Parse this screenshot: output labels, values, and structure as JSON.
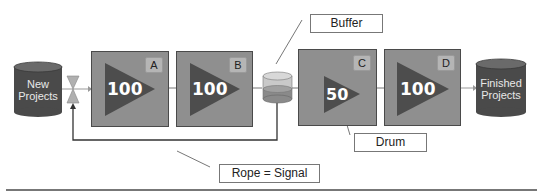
{
  "diagram": {
    "type": "drum-buffer-rope flow",
    "colors": {
      "box_fill": "#8f8f8f",
      "triangle_fill": "#4d4d4d",
      "cylinder_fill": "#4a4a4a",
      "cylinder_top": "#6a6a6a",
      "buffer_fill": "#c9c9c9",
      "buffer_level": "#8a8a8a",
      "line": "#333333"
    },
    "source": {
      "label_line1": "New",
      "label_line2": "Projects"
    },
    "valve": {
      "icon": "valve-icon"
    },
    "stations": [
      {
        "tag": "A",
        "capacity": "100"
      },
      {
        "tag": "B",
        "capacity": "100"
      },
      {
        "tag": "C",
        "capacity": "50"
      },
      {
        "tag": "D",
        "capacity": "100"
      }
    ],
    "buffer": {
      "icon": "buffer-cylinder-icon"
    },
    "sink": {
      "label_line1": "Finished",
      "label_line2": "Projects"
    },
    "callouts": {
      "buffer": "Buffer",
      "drum": "Drum",
      "rope": "Rope = Signal"
    }
  }
}
